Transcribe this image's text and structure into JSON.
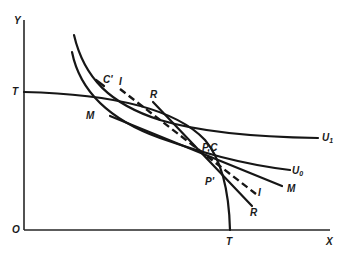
{
  "diagram": {
    "axes": {
      "y_label": "Y",
      "x_label": "X",
      "origin_label": "O",
      "y_intercept_label": "T",
      "x_intercept_label": "T"
    },
    "curves": [
      {
        "id": "transformation-curve",
        "label": "T",
        "style": "solid"
      },
      {
        "id": "indifference-u1",
        "label": "U",
        "subscript": "1",
        "style": "solid"
      },
      {
        "id": "indifference-u0",
        "label": "U",
        "subscript": "0",
        "style": "solid"
      }
    ],
    "lines": [
      {
        "id": "price-line-m",
        "label": "M",
        "style": "solid"
      },
      {
        "id": "price-line-r",
        "label": "R",
        "style": "solid"
      },
      {
        "id": "price-line-i",
        "label": "I",
        "style": "dashed"
      }
    ],
    "points": [
      {
        "id": "point-pc",
        "label": "P,C"
      },
      {
        "id": "point-p-prime",
        "label": "P'"
      },
      {
        "id": "point-c-prime",
        "label": "C'"
      }
    ],
    "labels": {
      "M_left": "M",
      "M_right": "M",
      "R_top": "R",
      "R_bottom": "R",
      "I_top": "I",
      "I_bottom": "I",
      "U1": "U",
      "U1_sub": "1",
      "U0": "U",
      "U0_sub": "0",
      "PC": "P,C",
      "Pprime": "P'",
      "Cprime": "C'"
    }
  }
}
